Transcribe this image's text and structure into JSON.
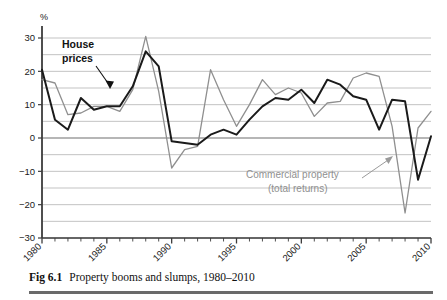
{
  "figure": {
    "caption_number": "Fig 6.1",
    "caption_text": "Property booms and slumps, 1980–2010"
  },
  "annotations": {
    "house_prices_line1": "House",
    "house_prices_line2": "prices",
    "commercial_line1": "Commercial property",
    "commercial_line2": "(total returns)"
  },
  "colors": {
    "house_prices": "#1a1a1a",
    "commercial_property": "#8f8f8f",
    "gridline": "#b4b4b4",
    "zero_line": "#6e6e6e",
    "axis": "#3c3c3c",
    "caption_rule": "#6a6a6a",
    "background": "#ffffff"
  },
  "chart_data": {
    "type": "line",
    "title": "Property booms and slumps, 1980–2010",
    "xlabel": "",
    "ylabel": "%",
    "ylim": [
      -30,
      30
    ],
    "xlim": [
      1980,
      2010
    ],
    "grid": true,
    "grid_interval": 5,
    "legend_position": "inline-annotation",
    "ytick_labels": [
      "30",
      "20",
      "10",
      "0",
      "−10",
      "−20",
      "−30"
    ],
    "ytick_values": [
      30,
      20,
      10,
      0,
      -10,
      -20,
      -30
    ],
    "xtick_labels": [
      "1980",
      "1985",
      "1990",
      "1995",
      "2000",
      "2005",
      "2010"
    ],
    "xtick_values": [
      1980,
      1985,
      1990,
      1995,
      2000,
      2005,
      2010
    ],
    "x": [
      1980,
      1981,
      1982,
      1983,
      1984,
      1985,
      1986,
      1987,
      1988,
      1989,
      1990,
      1991,
      1992,
      1993,
      1994,
      1995,
      1996,
      1997,
      1998,
      1999,
      2000,
      2001,
      2002,
      2003,
      2004,
      2005,
      2006,
      2007,
      2008,
      2009,
      2010
    ],
    "series": [
      {
        "name": "House prices",
        "color": "#1a1a1a",
        "values": [
          20.5,
          5.5,
          2.5,
          12.0,
          8.5,
          9.5,
          9.5,
          15.5,
          26.0,
          21.5,
          -1.0,
          -1.5,
          -2.0,
          1.0,
          2.5,
          1.0,
          5.5,
          9.5,
          12.0,
          11.5,
          14.5,
          10.5,
          17.5,
          16.0,
          12.5,
          11.5,
          2.5,
          11.5,
          11.0,
          -12.5,
          0.5
        ]
      },
      {
        "name": "Commercial property (total returns)",
        "color": "#8f8f8f",
        "values": [
          17.5,
          16.5,
          7.0,
          7.5,
          9.5,
          9.5,
          8.0,
          14.5,
          30.5,
          14.0,
          -9.0,
          -3.5,
          -2.5,
          20.5,
          11.5,
          3.5,
          10.0,
          17.5,
          13.0,
          15.0,
          13.5,
          6.5,
          10.5,
          11.0,
          18.0,
          19.5,
          18.5,
          3.5,
          -22.5,
          3.0,
          8.0
        ]
      }
    ]
  }
}
